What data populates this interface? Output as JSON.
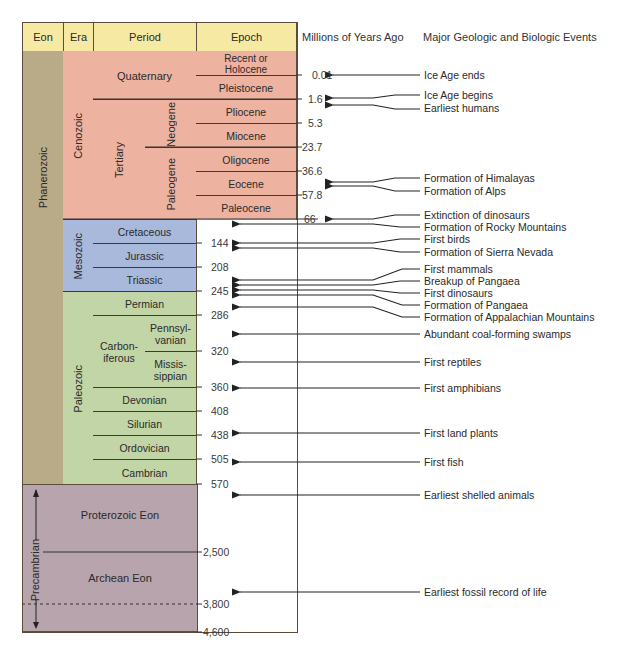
{
  "headers": {
    "eon": "Eon",
    "era": "Era",
    "period": "Period",
    "epoch": "Epoch",
    "mya": "Millions of Years Ago",
    "events": "Major Geologic and Biologic Events"
  },
  "eons": {
    "phanerozoic": "Phanerozoic",
    "precambrian": "Precambrian",
    "proterozoic": "Proterozoic Eon",
    "archean": "Archean Eon"
  },
  "eras": {
    "cenozoic": "Cenozoic",
    "mesozoic": "Mesozoic",
    "paleozoic": "Paleozoic"
  },
  "periods": {
    "quaternary": "Quaternary",
    "tertiary": "Tertiary",
    "neogene": "Neogene",
    "paleogene": "Paleogene",
    "cretaceous": "Cretaceous",
    "jurassic": "Jurassic",
    "triassic": "Triassic",
    "permian": "Permian",
    "carboniferous": "Carbon-\niferous",
    "pennsylvanian": "Pennsyl-\nvanian",
    "mississippian": "Missis-\nsippian",
    "devonian": "Devonian",
    "silurian": "Silurian",
    "ordovician": "Ordovician",
    "cambrian": "Cambrian"
  },
  "epochs": {
    "holocene": "Recent or\nHolocene",
    "pleistocene": "Pleistocene",
    "pliocene": "Pliocene",
    "miocene": "Miocene",
    "oligocene": "Oligocene",
    "eocene": "Eocene",
    "paleocene": "Paleocene"
  },
  "ages": [
    "0.01",
    "1.6",
    "5.3",
    "23.7",
    "36.6",
    "57.8",
    "66",
    "144",
    "208",
    "245",
    "286",
    "320",
    "360",
    "408",
    "438",
    "505",
    "570",
    "2,500",
    "3,800",
    "4,600"
  ],
  "events": [
    "Ice Age ends",
    "Ice Age begins",
    "Earliest humans",
    "Formation of Himalayas",
    "Formation of Alps",
    "Extinction of dinosaurs",
    "Formation of Rocky Mountains",
    "First birds",
    "Formation of Sierra Nevada",
    "First mammals",
    "Breakup of Pangaea",
    "First dinosaurs",
    "Formation of Pangaea",
    "Formation of Appalachian Mountains",
    "Abundant coal-forming swamps",
    "First reptiles",
    "First amphibians",
    "First land plants",
    "First fish",
    "Earliest shelled animals",
    "Earliest fossil record of life"
  ],
  "colors": {
    "header": "#f6e9a4",
    "cenozoic": "#eeb2a0",
    "mesozoic": "#a9b9dc",
    "paleozoic": "#c2d5a6",
    "phanerozoic": "#b9ab88",
    "precambrian": "#b7a4ad"
  }
}
